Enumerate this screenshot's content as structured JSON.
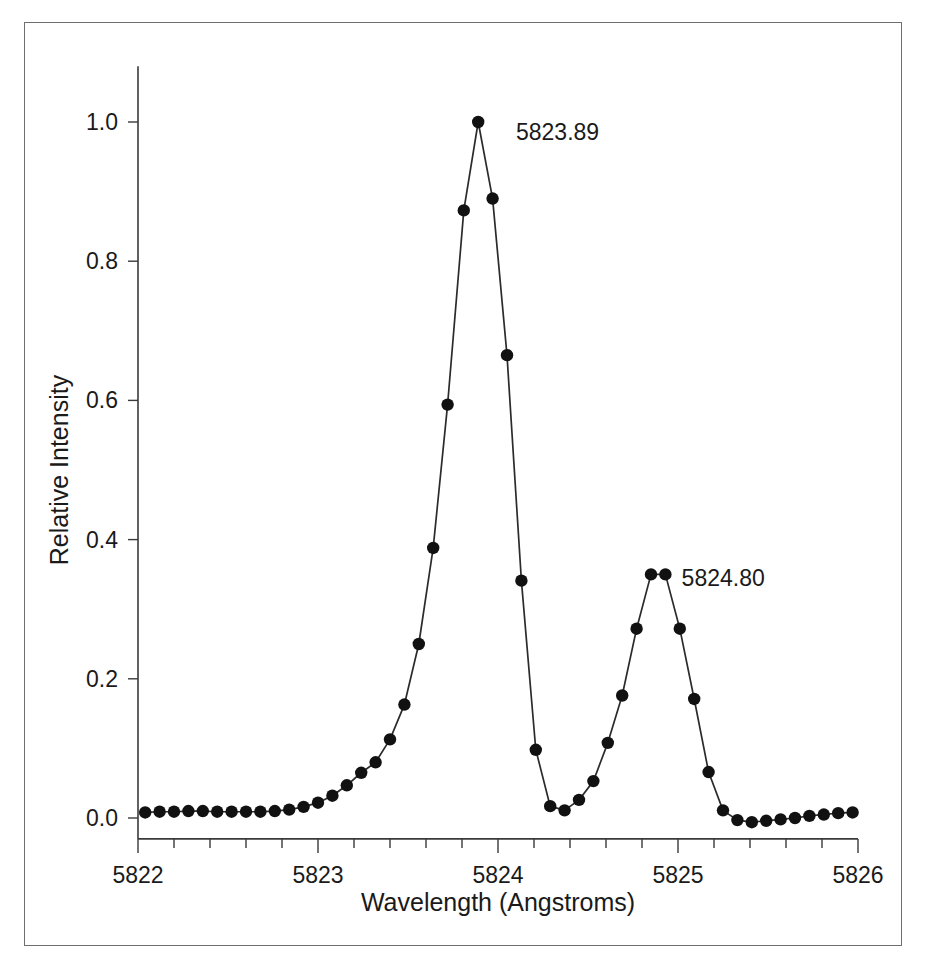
{
  "figure": {
    "background_color": "#ffffff",
    "frame_color": "#6e6e73",
    "line_color": "#2b2b2b",
    "marker_color": "#111111",
    "text_color": "#1a1a1a"
  },
  "chart_data": {
    "type": "line",
    "title": "",
    "subtitle": "",
    "xlabel": "Wavelength (Angstroms)",
    "ylabel": "Relative Intensity",
    "xlim": [
      5822.0,
      5826.0
    ],
    "ylim": [
      -0.03,
      1.08
    ],
    "grid": false,
    "legend": null,
    "legend_position": "none",
    "markers": "filled-circle",
    "xticks": [
      5822,
      5823,
      5824,
      5825,
      5826
    ],
    "xtick_labels": [
      "5822",
      "5823",
      "5824",
      "5825",
      "5826"
    ],
    "xminor_tick_interval": 0.2,
    "yticks": [
      0.0,
      0.2,
      0.4,
      0.6,
      0.8,
      1.0
    ],
    "ytick_labels": [
      "0.0",
      "0.2",
      "0.4",
      "0.6",
      "0.8",
      "1.0"
    ],
    "annotations": [
      {
        "text": "5823.89",
        "x": 5824.1,
        "y": 0.985,
        "describes_peak": 1
      },
      {
        "text": "5824.80",
        "x": 5825.02,
        "y": 0.345,
        "describes_peak": 2
      }
    ],
    "series": [
      {
        "name": "Spectrum",
        "x": [
          5822.04,
          5822.12,
          5822.2,
          5822.28,
          5822.36,
          5822.44,
          5822.52,
          5822.6,
          5822.68,
          5822.76,
          5822.84,
          5822.92,
          5823.0,
          5823.08,
          5823.16,
          5823.24,
          5823.32,
          5823.4,
          5823.48,
          5823.56,
          5823.64,
          5823.72,
          5823.81,
          5823.89,
          5823.97,
          5824.05,
          5824.13,
          5824.21,
          5824.29,
          5824.37,
          5824.45,
          5824.53,
          5824.61,
          5824.69,
          5824.77,
          5824.85,
          5824.93,
          5825.01,
          5825.09,
          5825.17,
          5825.25,
          5825.33,
          5825.41,
          5825.49,
          5825.57,
          5825.65,
          5825.73,
          5825.81,
          5825.89,
          5825.97
        ],
        "y": [
          0.008,
          0.009,
          0.009,
          0.01,
          0.01,
          0.009,
          0.009,
          0.009,
          0.009,
          0.01,
          0.012,
          0.016,
          0.022,
          0.032,
          0.047,
          0.065,
          0.08,
          0.113,
          0.163,
          0.25,
          0.388,
          0.594,
          0.873,
          1.0,
          0.89,
          0.665,
          0.341,
          0.098,
          0.017,
          0.011,
          0.026,
          0.053,
          0.108,
          0.176,
          0.272,
          0.35,
          0.35,
          0.272,
          0.171,
          0.066,
          0.011,
          -0.003,
          -0.006,
          -0.004,
          -0.002,
          0.0,
          0.003,
          0.005,
          0.007,
          0.008
        ]
      }
    ],
    "peaks": [
      {
        "label": "5823.89",
        "wavelength": 5823.89,
        "intensity": 1.0
      },
      {
        "label": "5824.80",
        "wavelength": 5824.8,
        "intensity": 0.35
      }
    ]
  }
}
